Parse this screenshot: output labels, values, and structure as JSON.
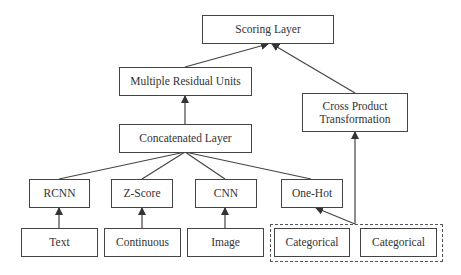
{
  "diagram": {
    "nodes": {
      "scoring": {
        "label": "Scoring Layer"
      },
      "residual": {
        "label": "Multiple Residual Units"
      },
      "cross": {
        "label": "Cross Product Transformation"
      },
      "concat": {
        "label": "Concatenated Layer"
      },
      "rcnn": {
        "label": "RCNN"
      },
      "zscore": {
        "label": "Z-Score"
      },
      "cnn": {
        "label": "CNN"
      },
      "onehot": {
        "label": "One-Hot"
      },
      "text": {
        "label": "Text"
      },
      "continuous": {
        "label": "Continuous"
      },
      "image": {
        "label": "Image"
      },
      "cat1": {
        "label": "Categorical"
      },
      "cat2": {
        "label": "Categorical"
      }
    },
    "groups": [
      {
        "name": "categorical-group",
        "members": [
          "cat1",
          "cat2"
        ],
        "style": "dashed"
      }
    ],
    "edges": [
      {
        "from": "text",
        "to": "rcnn",
        "arrow": true
      },
      {
        "from": "continuous",
        "to": "zscore",
        "arrow": true
      },
      {
        "from": "image",
        "to": "cnn",
        "arrow": true
      },
      {
        "from": "categorical-group",
        "to": "onehot",
        "arrow": true
      },
      {
        "from": "categorical-group",
        "to": "cross",
        "arrow": true
      },
      {
        "from": "rcnn",
        "to": "concat",
        "arrow": false
      },
      {
        "from": "zscore",
        "to": "concat",
        "arrow": false
      },
      {
        "from": "cnn",
        "to": "concat",
        "arrow": false
      },
      {
        "from": "onehot",
        "to": "concat",
        "arrow": false
      },
      {
        "from": "concat",
        "to": "residual",
        "arrow": true
      },
      {
        "from": "residual",
        "to": "scoring",
        "arrow": true
      },
      {
        "from": "cross",
        "to": "scoring",
        "arrow": true
      }
    ]
  }
}
